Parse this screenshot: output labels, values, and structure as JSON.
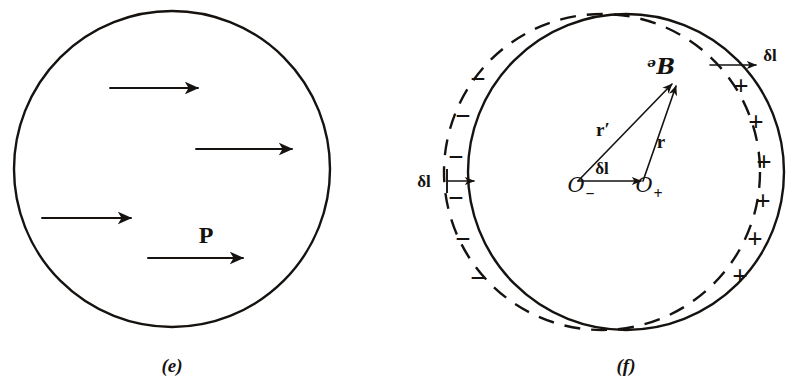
{
  "figure": {
    "background_color": "#ffffff",
    "ink_color": "#15120f",
    "width": 797,
    "height": 385
  },
  "panels": [
    {
      "id": "e",
      "caption": "(e)",
      "caption_x": 172,
      "caption_y": 372,
      "circle": {
        "cx": 172,
        "cy": 169,
        "r": 158,
        "style": "solid"
      },
      "polarization_label": {
        "text": "P",
        "x": 206,
        "y": 243
      },
      "arrows": [
        {
          "name": "polarization-arrow-1",
          "x1": 110,
          "y1": 88,
          "x2": 198,
          "y2": 88
        },
        {
          "name": "polarization-arrow-2",
          "x1": 196,
          "y1": 149,
          "x2": 292,
          "y2": 149
        },
        {
          "name": "polarization-arrow-3",
          "x1": 42,
          "y1": 218,
          "x2": 131,
          "y2": 218
        },
        {
          "name": "polarization-arrow-4",
          "x1": 148,
          "y1": 258,
          "x2": 243,
          "y2": 258
        }
      ]
    },
    {
      "id": "f",
      "caption": "(f)",
      "caption_x": 626,
      "caption_y": 372,
      "positive_circle": {
        "cx": 626,
        "cy": 172,
        "r": 158,
        "style": "solid",
        "name": "positive-charge-sphere"
      },
      "negative_circle": {
        "cx": 602,
        "cy": 172,
        "r": 158,
        "style": "dashed",
        "name": "negative-charge-sphere"
      },
      "origin_minus": {
        "label": "O",
        "subscript": "−",
        "x": 576,
        "y": 190
      },
      "origin_plus": {
        "label": "O",
        "subscript": "+",
        "x": 646,
        "y": 190
      },
      "field_point": {
        "label": "ᵊB",
        "x": 663,
        "y": 70,
        "px": 675,
        "py": 82
      },
      "vectors": [
        {
          "name": "vector-r-prime",
          "label": "r′",
          "x1": 578,
          "y1": 181,
          "x2": 672,
          "y2": 84,
          "lx": 603,
          "ly": 136
        },
        {
          "name": "vector-r",
          "label": "r",
          "x1": 643,
          "y1": 181,
          "x2": 676,
          "y2": 86,
          "lx": 659,
          "ly": 146
        },
        {
          "name": "vector-delta-l-center",
          "label": "δl",
          "x1": 578,
          "y1": 181,
          "x2": 641,
          "y2": 181,
          "lx": 600,
          "ly": 172
        }
      ],
      "callouts": [
        {
          "name": "delta-l-callout-top-right",
          "label": "δl",
          "x1": 710,
          "y1": 65,
          "x2": 756,
          "y2": 65,
          "lx": 763,
          "ly": 59,
          "tick": null
        },
        {
          "name": "delta-l-callout-left",
          "label": "δl",
          "x1": 448,
          "y1": 180,
          "x2": 474,
          "y2": 180,
          "lx": 416,
          "ly": 185,
          "tick": {
            "x": 447,
            "y1": 169,
            "y2": 193
          }
        }
      ],
      "minus_signs": [
        {
          "text": "−",
          "x": 478,
          "y": 88
        },
        {
          "text": "−",
          "x": 463,
          "y": 125
        },
        {
          "text": "−",
          "x": 456,
          "y": 166
        },
        {
          "text": "−",
          "x": 456,
          "y": 207
        },
        {
          "text": "−",
          "x": 463,
          "y": 248
        },
        {
          "text": "−",
          "x": 478,
          "y": 287
        }
      ],
      "plus_signs": [
        {
          "text": "+",
          "x": 741,
          "y": 95
        },
        {
          "text": "+",
          "x": 756,
          "y": 131
        },
        {
          "text": "+",
          "x": 764,
          "y": 171
        },
        {
          "text": "+",
          "x": 763,
          "y": 210
        },
        {
          "text": "+",
          "x": 755,
          "y": 248
        },
        {
          "text": "+",
          "x": 740,
          "y": 285
        }
      ]
    }
  ]
}
